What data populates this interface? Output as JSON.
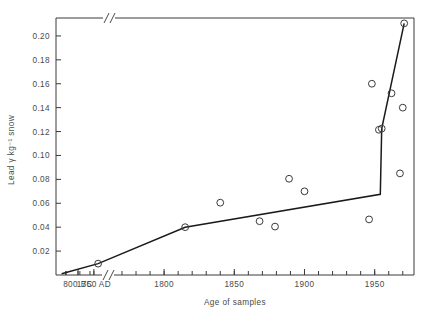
{
  "chart_data": {
    "type": "scatter",
    "title": "",
    "xlabel": "Age of samples",
    "ylabel": "Lead γ kg⁻¹ snow",
    "xlim": [
      1723,
      1978
    ],
    "ylim": [
      0.0,
      0.215
    ],
    "grid": false,
    "legend": null,
    "axis_break": {
      "axis": "x",
      "present": true,
      "symbol": "//",
      "note": "break between 800 BC region and 1750 AD"
    },
    "xtick_labels": [
      "800 BC",
      "1750 AD",
      "1800",
      "1850",
      "1900",
      "1950"
    ],
    "xtick_values": [
      -800,
      1750,
      1800,
      1850,
      1900,
      1950
    ],
    "xminor_step": 10,
    "ytick_labels": [
      "0.02",
      "0.04",
      "0.06",
      "0.08",
      "0.10",
      "0.12",
      "0.14",
      "0.16",
      "0.18",
      "0.20"
    ],
    "ytick_values": [
      0.02,
      0.04,
      0.06,
      0.08,
      0.1,
      0.12,
      0.14,
      0.16,
      0.18,
      0.2
    ],
    "series": [
      {
        "name": "Lead concentration in snow",
        "marker": "open-circle",
        "color": "#333333",
        "points": [
          {
            "x": 1753,
            "y": 0.0095
          },
          {
            "x": 1815,
            "y": 0.04
          },
          {
            "x": 1840,
            "y": 0.0605
          },
          {
            "x": 1868,
            "y": 0.045
          },
          {
            "x": 1879,
            "y": 0.0405
          },
          {
            "x": 1889,
            "y": 0.0805
          },
          {
            "x": 1900,
            "y": 0.07
          },
          {
            "x": 1946,
            "y": 0.0465
          },
          {
            "x": 1948,
            "y": 0.16
          },
          {
            "x": 1953,
            "y": 0.1215
          },
          {
            "x": 1955,
            "y": 0.1225
          },
          {
            "x": 1962,
            "y": 0.152
          },
          {
            "x": 1968,
            "y": 0.085
          },
          {
            "x": 1970,
            "y": 0.14
          },
          {
            "x": 1971,
            "y": 0.2105
          }
        ]
      }
    ],
    "trend_line": {
      "name": "trend",
      "color": "#1a1a1a",
      "points": [
        {
          "x": 1727,
          "y": 0.001
        },
        {
          "x": 1753,
          "y": 0.0095
        },
        {
          "x": 1815,
          "y": 0.04
        },
        {
          "x": 1954,
          "y": 0.0675
        },
        {
          "x": 1955,
          "y": 0.1225
        },
        {
          "x": 1971,
          "y": 0.2105
        }
      ]
    }
  },
  "figure": {
    "background_color": "#ffffff",
    "axis_color": "#3a3a3a",
    "text_color": "#4a4a4a",
    "line_color": "#1a1a1a"
  }
}
